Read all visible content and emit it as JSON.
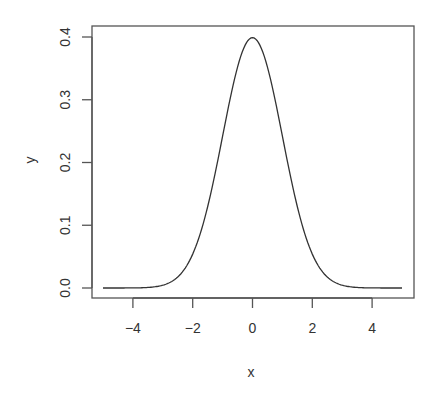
{
  "chart_data": {
    "type": "line",
    "title": "",
    "xlabel": "x",
    "ylabel": "y",
    "xlim": [
      -5,
      5
    ],
    "ylim": [
      0,
      0.4
    ],
    "grid": false,
    "legend": null,
    "x_ticks": [
      -4,
      -2,
      0,
      2,
      4
    ],
    "x_tick_labels": [
      "−4",
      "−2",
      "0",
      "2",
      "4"
    ],
    "y_ticks": [
      0.0,
      0.1,
      0.2,
      0.3,
      0.4
    ],
    "y_tick_labels": [
      "0.0",
      "0.1",
      "0.2",
      "0.3",
      "0.4"
    ],
    "series": [
      {
        "name": "dnorm(x)",
        "description": "Standard normal density, mean 0, sd 1",
        "color": "#333333",
        "x": [
          -5,
          -4.5,
          -4,
          -3.5,
          -3,
          -2.5,
          -2,
          -1.5,
          -1,
          -0.5,
          0,
          0.5,
          1,
          1.5,
          2,
          2.5,
          3,
          3.5,
          4,
          4.5,
          5
        ],
        "y": [
          0.0,
          0.0,
          0.0001,
          0.0009,
          0.0044,
          0.0175,
          0.054,
          0.1295,
          0.242,
          0.3521,
          0.3989,
          0.3521,
          0.242,
          0.1295,
          0.054,
          0.0175,
          0.0044,
          0.0009,
          0.0001,
          0.0,
          0.0
        ]
      }
    ]
  },
  "layout": {
    "plot_box": {
      "left": 92,
      "top": 26,
      "right": 414,
      "bottom": 298
    },
    "x_px_per_unit": 29.9,
    "x_zero_px": 252.5,
    "y_zero_px": 288,
    "y_px_per_unit": 627.5
  }
}
